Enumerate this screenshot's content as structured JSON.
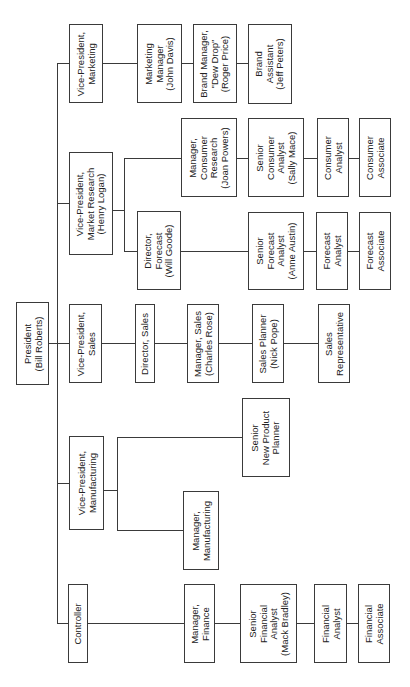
{
  "chart": {
    "type": "org-chart",
    "orientation": "rotated-90",
    "colors": {
      "line": "#3a3a3a",
      "text": "#222222",
      "background": "#ffffff"
    }
  },
  "nodes": {
    "president": "President\n(Bill Roberts)",
    "vp_marketing": "Vice-President,\nMarketing",
    "marketing_manager": "Marketing\nManager\n(John Davis)",
    "brand_manager": "Brand Manager,\n\"Dew Drop\"\n(Roger Price)",
    "brand_assistant": "Brand\nAssistant\n(Jeff Peters)",
    "vp_market_research": "Vice-President,\nMarket Research\n(Henry Logan)",
    "manager_consumer_research": "Manager,\nConsumer\nResearch\n(Joan Powers)",
    "senior_consumer_analyst": "Senior\nConsumer\nAnalyst\n(Sally Mace)",
    "consumer_analyst": "Consumer\nAnalyst",
    "consumer_associate": "Consumer\nAssociate",
    "director_forecast": "Director,\nForecast\n(Will Goode)",
    "senior_forecast_analyst": "Senior\nForecast\nAnalyst\n(Anne Austin)",
    "forecast_analyst": "Forecast\nAnalyst",
    "forecast_associate": "Forecast\nAssociate",
    "vp_sales": "Vice-President,\nSales",
    "director_sales": "Director, Sales",
    "manager_sales": "Manager, Sales\n(Charles Rose)",
    "sales_planner": "Sales Planner\n(Nick Pope)",
    "sales_representative": "Sales\nRepresentative",
    "vp_manufacturing": "Vice-President,\nManufacturing",
    "senior_new_product_planner": "Senior\nNew Product\nPlanner",
    "manager_manufacturing": "Manager,\nManufacturing",
    "controller": "Controller",
    "manager_finance": "Manager,\nFinance",
    "senior_financial_analyst": "Senior\nFinancial\nAnalyst\n(Mack Bradley)",
    "financial_analyst": "Financial\nAnalyst",
    "financial_associate": "Financial\nAssociate"
  }
}
